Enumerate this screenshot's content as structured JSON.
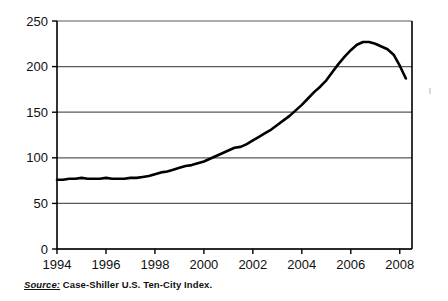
{
  "figure": {
    "background_color": "#ffffff",
    "line_color": "#000000",
    "grid_color": "#595959",
    "axis_color": "#000000"
  },
  "source_note": {
    "label": "Source:",
    "text": " Case-Shiller U.S. Ten-City Index."
  },
  "chart_data": {
    "type": "line",
    "title": "",
    "subtitle": "",
    "xlabel": "",
    "ylabel": "",
    "xlim": [
      1994,
      2008.5
    ],
    "ylim": [
      0,
      250
    ],
    "grid": true,
    "grid_axis": "y",
    "legend": false,
    "legend_position": "none",
    "yticks": [
      0,
      50,
      100,
      150,
      200,
      250
    ],
    "ytick_labels": [
      "0",
      "50",
      "100",
      "150",
      "200",
      "250"
    ],
    "xticks": [
      1994,
      1996,
      1998,
      2000,
      2002,
      2004,
      2006,
      2008
    ],
    "xtick_labels": [
      "1994",
      "1996",
      "1998",
      "2000",
      "2002",
      "2004",
      "2006",
      "2008"
    ],
    "series": [
      {
        "name": "Case-Shiller U.S. Ten-City Index",
        "color": "#000000",
        "x": [
          1994.0,
          1994.25,
          1994.5,
          1994.75,
          1995.0,
          1995.25,
          1995.5,
          1995.75,
          1996.0,
          1996.25,
          1996.5,
          1996.75,
          1997.0,
          1997.25,
          1997.5,
          1997.75,
          1998.0,
          1998.25,
          1998.5,
          1998.75,
          1999.0,
          1999.25,
          1999.5,
          1999.75,
          2000.0,
          2000.25,
          2000.5,
          2000.75,
          2001.0,
          2001.25,
          2001.5,
          2001.75,
          2002.0,
          2002.25,
          2002.5,
          2002.75,
          2003.0,
          2003.25,
          2003.5,
          2003.75,
          2004.0,
          2004.25,
          2004.5,
          2004.75,
          2005.0,
          2005.25,
          2005.5,
          2005.75,
          2006.0,
          2006.25,
          2006.5,
          2006.75,
          2007.0,
          2007.25,
          2007.5,
          2007.75,
          2008.0,
          2008.25
        ],
        "y": [
          76,
          76,
          77,
          77,
          78,
          77,
          77,
          77,
          78,
          77,
          77,
          77,
          78,
          78,
          79,
          80,
          82,
          84,
          85,
          87,
          89,
          91,
          92,
          94,
          96,
          99,
          102,
          105,
          108,
          111,
          112,
          115,
          119,
          123,
          127,
          131,
          136,
          141,
          146,
          152,
          158,
          165,
          172,
          178,
          185,
          194,
          203,
          211,
          218,
          224,
          227,
          227,
          225,
          222,
          219,
          213,
          201,
          187
        ]
      }
    ],
    "annotations": {
      "peak_value": 227,
      "peak_year": 2006.5,
      "start_value": 76,
      "end_value": 187,
      "end_year": 2008.25
    }
  }
}
